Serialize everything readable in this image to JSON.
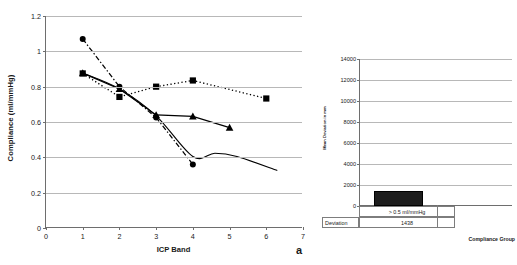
{
  "figure": {
    "panel_letter_a": "a"
  },
  "chart_data": [
    {
      "id": "compliance-vs-icp-band",
      "type": "line",
      "title": "",
      "panel_label": "a",
      "xlabel": "ICP Band",
      "ylabel": "Compliance (ml/mmHg)",
      "xlim": [
        0,
        7
      ],
      "ylim": [
        0,
        1.2
      ],
      "xticks": [
        0,
        1,
        2,
        3,
        4,
        5,
        6,
        7
      ],
      "xtick_labels": [
        "0",
        "1",
        "2",
        "3",
        "4",
        "5",
        "6",
        "7"
      ],
      "yticks": [
        0,
        0.2,
        0.4,
        0.6,
        0.8,
        1,
        1.2
      ],
      "ytick_labels": [
        "0",
        "0.2",
        "0.4",
        "0.6",
        "0.8",
        "1",
        "1.2"
      ],
      "grid": "horizontal",
      "legend": "none",
      "series": [
        {
          "name": "circle-dashed-series",
          "marker": "circle",
          "linestyle": "dash-dot",
          "color": "#000000",
          "x": [
            1,
            2,
            3,
            4
          ],
          "y": [
            1.07,
            0.8,
            0.625,
            0.36
          ]
        },
        {
          "name": "square-dotted-series",
          "marker": "square",
          "linestyle": "dotted",
          "color": "#000000",
          "x": [
            1,
            2,
            3,
            4,
            6
          ],
          "y": [
            0.875,
            0.742,
            0.8,
            0.835,
            0.733
          ]
        },
        {
          "name": "triangle-solid-series",
          "marker": "triangle",
          "linestyle": "solid",
          "color": "#000000",
          "x": [
            1,
            2,
            3,
            4,
            5
          ],
          "y": [
            0.877,
            0.787,
            0.64,
            0.632,
            0.568
          ]
        },
        {
          "name": "smooth-trend-curve",
          "marker": "none",
          "linestyle": "solid-smooth",
          "color": "#000000",
          "x": [
            1,
            2,
            3,
            4,
            4.6,
            5.2,
            6.3
          ],
          "y": [
            0.877,
            0.787,
            0.635,
            0.405,
            0.423,
            0.405,
            0.325
          ]
        }
      ]
    },
    {
      "id": "mean-deviation-by-compliance-group",
      "type": "bar",
      "title": "",
      "xlabel": "Compliance Group",
      "ylabel": "Mean Deviation in mm",
      "ylim": [
        0,
        14000
      ],
      "yticks": [
        0,
        2000,
        4000,
        6000,
        8000,
        10000,
        12000,
        14000
      ],
      "ytick_labels": [
        "0",
        "2000",
        "4000",
        "6000",
        "8000",
        "10000",
        "12000",
        "14000"
      ],
      "grid": "horizontal",
      "legend": "none",
      "categories": [
        "> 0.5 ml/mmHg"
      ],
      "values": [
        1438
      ],
      "data_table": {
        "row_label": "Deviation",
        "values": [
          "1438"
        ]
      }
    }
  ]
}
